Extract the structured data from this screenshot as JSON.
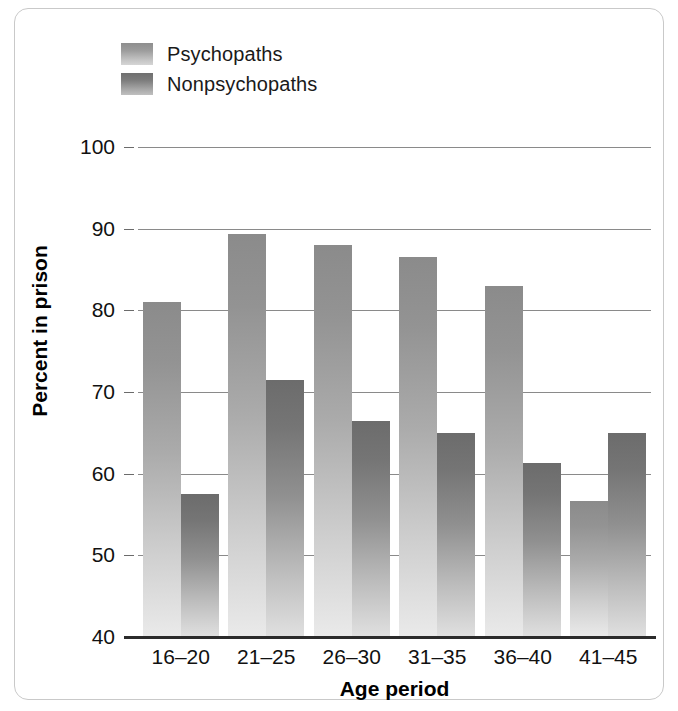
{
  "chart_data": {
    "type": "bar",
    "title": "",
    "xlabel": "Age period",
    "ylabel": "Percent in prison",
    "categories": [
      "16–20",
      "21–25",
      "26–30",
      "31–35",
      "36–40",
      "41–45"
    ],
    "series": [
      {
        "name": "Psychopaths",
        "values": [
          81,
          89.3,
          88,
          86.5,
          83,
          56.7
        ],
        "color": "#9d9d9d"
      },
      {
        "name": "Nonpsychopaths",
        "values": [
          57.5,
          71.5,
          66.5,
          65,
          61.3,
          65
        ],
        "color": "#7e7e7e"
      }
    ],
    "ylim": [
      40,
      100
    ],
    "yticks": [
      40,
      50,
      60,
      70,
      80,
      90,
      100
    ],
    "ytick_labels": [
      "40",
      "50",
      "60",
      "70",
      "80",
      "90",
      "100"
    ],
    "grid": true,
    "legend_position": "top-left"
  },
  "legend": {
    "items": [
      {
        "label": "Psychopaths",
        "swatch": "psychopaths-swatch"
      },
      {
        "label": "Nonpsychopaths",
        "swatch": "nonpsychopaths-swatch"
      }
    ]
  }
}
